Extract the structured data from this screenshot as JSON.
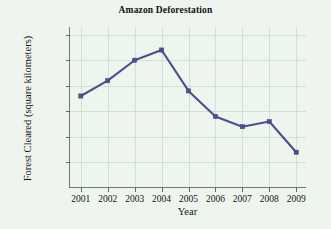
{
  "chart_data": {
    "type": "line",
    "title": "Amazon Deforestation",
    "xlabel": "Year",
    "ylabel": "Forest Cleared (square kilometers)",
    "categories": [
      "2001",
      "2002",
      "2003",
      "2004",
      "2005",
      "2006",
      "2007",
      "2008",
      "2009"
    ],
    "x": [
      2001,
      2002,
      2003,
      2004,
      2005,
      2006,
      2007,
      2008,
      2009
    ],
    "values": [
      18000,
      21000,
      25000,
      27000,
      19000,
      14000,
      12000,
      13000,
      7000
    ],
    "series": [
      {
        "name": "Forest Cleared",
        "values": [
          18000,
          21000,
          25000,
          27000,
          19000,
          14000,
          12000,
          13000,
          7000
        ]
      }
    ],
    "xlim": [
      2000.6,
      2009.4
    ],
    "ylim": [
      0,
      31500
    ],
    "ytick_values": [
      5000,
      10000,
      15000,
      20000,
      25000,
      30000
    ],
    "ytick_labels": [
      "5000",
      "10,000",
      "15,000",
      "20,000",
      "25,000",
      "30,000"
    ],
    "grid": true,
    "legend": false,
    "legend_position": "none",
    "line_color": "#4b4f8e",
    "marker": "square",
    "background_color": "#eef5ef",
    "axis_color": "#6e7a70",
    "grid_color": "#d3e0d6"
  }
}
